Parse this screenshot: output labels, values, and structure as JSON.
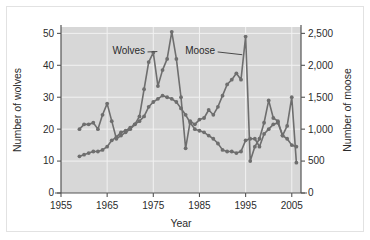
{
  "figure": {
    "background_color": "#ffffff",
    "plot_background_color": "#d7d7d7",
    "gridline_color": "#f2f2f2",
    "series_color": "#6e6e6e",
    "axis_color": "#555555"
  },
  "chart_data": {
    "type": "line",
    "title": "",
    "xlabel": "Year",
    "ylabel": "Number of wolves",
    "y2label": "Number of moose",
    "xlim": [
      1955,
      2007
    ],
    "ylim": [
      0,
      52
    ],
    "y2lim": [
      0,
      2600
    ],
    "xticks": [
      1955,
      1965,
      1975,
      1985,
      1995,
      2005
    ],
    "xtick_labels": [
      "1955",
      "1965",
      "1975",
      "1985",
      "1995",
      "2005"
    ],
    "yticks": [
      0,
      10,
      20,
      30,
      40,
      50
    ],
    "ytick_labels": [
      "0",
      "10",
      "20",
      "30",
      "40",
      "50"
    ],
    "y2ticks": [
      0,
      500,
      1000,
      1500,
      2000,
      2500
    ],
    "y2tick_labels": [
      "0",
      "500",
      "1,000",
      "1,500",
      "2,000",
      "2,500"
    ],
    "grid": true,
    "legend_position": "inline-annotation",
    "annotations": [
      {
        "text": "Wolves",
        "x": 1973.2,
        "y": 44.5,
        "points_to_x": 1976.2,
        "points_to_y": 44.0
      },
      {
        "text": "Moose",
        "x": 1988.4,
        "y": 44.5,
        "points_to_x": 1994.6,
        "points_to_y": 43.0
      }
    ],
    "series": [
      {
        "name": "Wolves",
        "axis": "left",
        "units": "wolves",
        "x": [
          1959,
          1960,
          1961,
          1962,
          1963,
          1964,
          1965,
          1966,
          1967,
          1968,
          1969,
          1970,
          1971,
          1972,
          1973,
          1974,
          1975,
          1976,
          1977,
          1978,
          1979,
          1980,
          1981,
          1982,
          1983,
          1984,
          1985,
          1986,
          1987,
          1988,
          1989,
          1990,
          1991,
          1992,
          1993,
          1994,
          1995,
          1996,
          1997,
          1998,
          1999,
          2000,
          2001,
          2002,
          2003,
          2004,
          2005,
          2006
        ],
        "values": [
          11.5,
          12.0,
          12.5,
          13.0,
          13.0,
          13.5,
          14.5,
          16.5,
          17.5,
          19.0,
          19.5,
          20.5,
          21.5,
          22.5,
          24.0,
          27.0,
          28.5,
          29.5,
          30.5,
          30.0,
          29.5,
          28.5,
          26.5,
          24.5,
          22.0,
          20.0,
          19.5,
          19.0,
          18.0,
          17.0,
          15.5,
          13.5,
          13.0,
          13.0,
          12.5,
          13.0,
          16.5,
          17.0,
          17.0,
          14.5,
          18.5,
          20.0,
          21.5,
          22.0,
          18.0,
          17.0,
          15.0,
          14.5
        ]
      },
      {
        "name": "Moose",
        "axis": "right",
        "units": "moose",
        "x": [
          1959,
          1960,
          1961,
          1962,
          1963,
          1964,
          1965,
          1966,
          1967,
          1968,
          1969,
          1970,
          1971,
          1972,
          1973,
          1974,
          1975,
          1976,
          1977,
          1978,
          1979,
          1980,
          1981,
          1982,
          1983,
          1984,
          1985,
          1986,
          1987,
          1988,
          1989,
          1990,
          1991,
          1992,
          1993,
          1994,
          1995,
          1996,
          1997,
          1998,
          1999,
          2000,
          2001,
          2002,
          2003,
          2004,
          2005,
          2006
        ],
        "values": [
          1000,
          1075,
          1075,
          1100,
          1000,
          1225,
          1400,
          1125,
          850,
          900,
          950,
          1000,
          1075,
          1200,
          1625,
          2050,
          2200,
          1675,
          1925,
          2100,
          2525,
          2100,
          1500,
          700,
          1125,
          1075,
          1150,
          1175,
          1300,
          1225,
          1350,
          1525,
          1700,
          1775,
          1875,
          1775,
          2450,
          500,
          725,
          850,
          1100,
          1450,
          1175,
          1125,
          900,
          1050,
          1500,
          475
        ]
      }
    ]
  }
}
